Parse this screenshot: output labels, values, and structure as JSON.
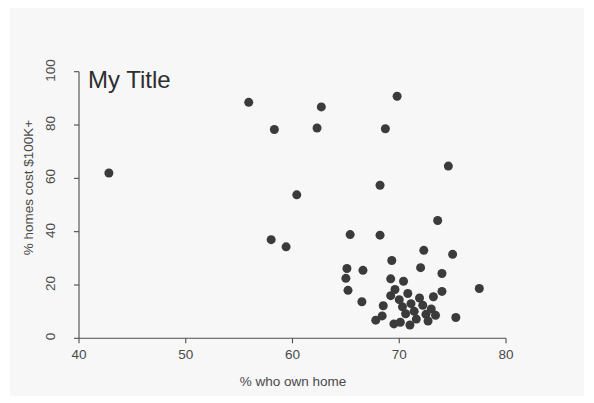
{
  "chart_data": {
    "type": "scatter",
    "title": "My Title",
    "xlabel": "% who own home",
    "ylabel": "% homes cost $100K+",
    "xlim": [
      40,
      80
    ],
    "ylim": [
      0,
      100
    ],
    "xticks": [
      40,
      50,
      60,
      70,
      80
    ],
    "yticks": [
      0,
      20,
      40,
      60,
      80,
      100
    ],
    "grid": false,
    "legend": null,
    "marker": {
      "shape": "circle",
      "color": "#3b3b3b",
      "size_px": 9
    },
    "series": [
      {
        "name": "states",
        "color": "#3b3b3b",
        "points": [
          [
            42.8,
            62.0
          ],
          [
            55.9,
            88.5
          ],
          [
            58.3,
            78.3
          ],
          [
            62.7,
            86.8
          ],
          [
            62.3,
            78.9
          ],
          [
            69.8,
            90.8
          ],
          [
            68.7,
            78.6
          ],
          [
            74.6,
            64.6
          ],
          [
            60.4,
            53.8
          ],
          [
            68.2,
            57.4
          ],
          [
            73.6,
            44.2
          ],
          [
            58.0,
            37.0
          ],
          [
            59.4,
            34.3
          ],
          [
            65.4,
            38.9
          ],
          [
            68.2,
            38.7
          ],
          [
            65.1,
            26.2
          ],
          [
            65.0,
            22.5
          ],
          [
            65.2,
            18.0
          ],
          [
            66.6,
            25.5
          ],
          [
            66.5,
            13.7
          ],
          [
            69.3,
            29.2
          ],
          [
            69.2,
            22.3
          ],
          [
            70.4,
            21.4
          ],
          [
            72.0,
            26.5
          ],
          [
            72.3,
            33.0
          ],
          [
            75.0,
            31.5
          ],
          [
            74.0,
            24.3
          ],
          [
            77.5,
            18.7
          ],
          [
            75.3,
            7.8
          ],
          [
            74.0,
            17.6
          ],
          [
            73.0,
            11.0
          ],
          [
            68.5,
            12.2
          ],
          [
            68.4,
            8.4
          ],
          [
            69.2,
            16.0
          ],
          [
            69.6,
            18.3
          ],
          [
            70.0,
            14.5
          ],
          [
            70.3,
            11.8
          ],
          [
            70.6,
            9.2
          ],
          [
            70.8,
            16.8
          ],
          [
            71.1,
            13.0
          ],
          [
            71.4,
            10.1
          ],
          [
            71.6,
            7.2
          ],
          [
            71.9,
            15.1
          ],
          [
            72.2,
            12.4
          ],
          [
            72.5,
            9.0
          ],
          [
            72.7,
            6.5
          ],
          [
            70.1,
            6.0
          ],
          [
            69.5,
            5.4
          ],
          [
            71.0,
            5.0
          ],
          [
            73.2,
            15.6
          ],
          [
            73.4,
            8.6
          ],
          [
            67.8,
            6.8
          ]
        ]
      }
    ]
  },
  "axes": {
    "x_tick_labels": [
      "40",
      "50",
      "60",
      "70",
      "80"
    ],
    "y_tick_labels": [
      "0",
      "20",
      "40",
      "60",
      "80",
      "100"
    ]
  }
}
